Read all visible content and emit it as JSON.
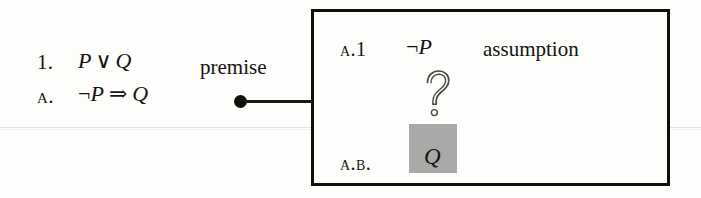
{
  "figure": {
    "type": "natural-deduction-subproof-diagram",
    "background_color": "#fdfdfb",
    "ink_color": "#15120f",
    "highlight_color": "#a9a9a7"
  },
  "derivation": {
    "lines": [
      {
        "number": "1.",
        "formula": "P ∨ Q",
        "formula_left": "P",
        "formula_operator": "∨",
        "formula_right": "Q",
        "justification": "premise"
      },
      {
        "number": "A.",
        "formula": "¬P ⇒ Q",
        "formula_left": "¬P",
        "formula_operator": "⇒",
        "formula_right": "Q",
        "justification": ""
      }
    ]
  },
  "connector": {
    "dot_label": "subproof-anchor-dot",
    "line_label": "subproof-connector-line"
  },
  "subproof": {
    "lines": [
      {
        "number": "A.1",
        "formula": "¬P",
        "justification": "assumption"
      },
      {
        "number": "A.B.",
        "formula": "Q",
        "justification": "",
        "highlighted": true
      }
    ],
    "gap_symbol": "?"
  }
}
